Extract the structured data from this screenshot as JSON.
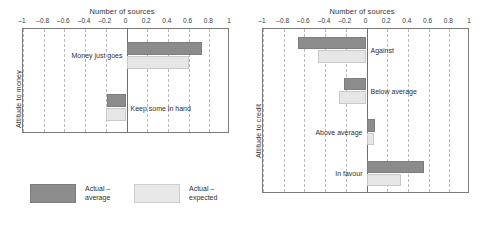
{
  "legend": {
    "position": "bottom-left",
    "entries": [
      {
        "label_line1": "Actual –",
        "label_line2": "average",
        "color": "#8c8c8c",
        "swatch": "dark"
      },
      {
        "label_line1": "Actual –",
        "label_line2": "expected",
        "color": "#e8e8e8",
        "swatch": "light"
      }
    ]
  },
  "chart_data": [
    {
      "type": "bar",
      "orientation": "horizontal",
      "title": "",
      "xlabel": "Number of sources",
      "ylabel": "Attitude to money",
      "xlim": [
        -1,
        1
      ],
      "xticks": [
        -1,
        -0.8,
        -0.6,
        -0.4,
        -0.2,
        0,
        0.2,
        0.4,
        0.6,
        0.8,
        1
      ],
      "xticklabels": [
        "–1",
        "–0.8",
        "–0.6",
        "–0.4",
        "–0.2",
        "0",
        "0.2",
        "0.4",
        "0.6",
        "0.8",
        "1"
      ],
      "grid": "vertical-dashed",
      "categories": [
        "Money just goes",
        "Keep some in hand"
      ],
      "series": [
        {
          "name": "Actual – average",
          "color": "#8c8c8c",
          "values": [
            0.73,
            -0.19
          ]
        },
        {
          "name": "Actual – expected",
          "color": "#e6e6e6",
          "values": [
            0.6,
            -0.2
          ]
        }
      ],
      "category_label_side": [
        "left",
        "right"
      ]
    },
    {
      "type": "bar",
      "orientation": "horizontal",
      "title": "",
      "xlabel": "Number of sources",
      "ylabel": "Attitude to credit",
      "xlim": [
        -1,
        1
      ],
      "xticks": [
        -1,
        -0.8,
        -0.6,
        -0.4,
        -0.2,
        0,
        0.2,
        0.4,
        0.6,
        0.8,
        1
      ],
      "xticklabels": [
        "–1",
        "–0.8",
        "–0.6",
        "–0.4",
        "–0.2",
        "0",
        "0.2",
        "0.4",
        "0.6",
        "0.8",
        "1"
      ],
      "grid": "vertical-dashed",
      "categories": [
        "Against",
        "Below average",
        "Above average",
        "In favour"
      ],
      "series": [
        {
          "name": "Actual – average",
          "color": "#8c8c8c",
          "values": [
            -0.66,
            -0.22,
            0.08,
            0.56
          ]
        },
        {
          "name": "Actual – expected",
          "color": "#e6e6e6",
          "values": [
            -0.47,
            -0.27,
            0.07,
            0.33
          ]
        }
      ],
      "category_label_side": [
        "right",
        "right",
        "left",
        "left"
      ]
    }
  ]
}
